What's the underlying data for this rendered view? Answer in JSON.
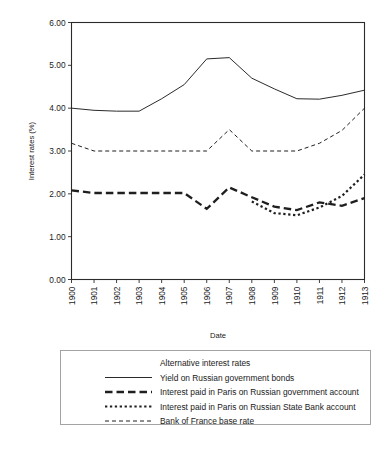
{
  "chart_data": {
    "type": "line",
    "title": "",
    "xlabel": "Date",
    "ylabel": "Interest rates (%)",
    "x": [
      "1900",
      "1901",
      "1902",
      "1903",
      "1904",
      "1905",
      "1906",
      "1907",
      "1908",
      "1909",
      "1910",
      "1911",
      "1912",
      "1913"
    ],
    "xlim": [
      1900,
      1913
    ],
    "ylim": [
      0.0,
      6.0
    ],
    "yticks": [
      "0.00",
      "1.00",
      "2.00",
      "3.00",
      "4.00",
      "5.00",
      "6.00"
    ],
    "grid": false,
    "legend_position": "below-plot",
    "legend_title": "Alternative interest rates",
    "series": [
      {
        "name": "Yield on Russian government bonds",
        "style": "solid-thin",
        "values": [
          4.0,
          3.95,
          3.93,
          3.93,
          4.22,
          4.55,
          5.15,
          5.18,
          4.7,
          4.45,
          4.22,
          4.21,
          4.3,
          4.42
        ]
      },
      {
        "name": "Interest paid in Paris on Russian government account",
        "style": "dash-thick-long",
        "values": [
          2.08,
          2.02,
          2.02,
          2.02,
          2.02,
          2.02,
          1.65,
          2.15,
          1.92,
          1.7,
          1.62,
          1.8,
          1.72,
          1.9
        ]
      },
      {
        "name": "Interest paid in Paris on Russian State Bank account",
        "style": "dot-thick-short",
        "values": [
          null,
          null,
          null,
          null,
          null,
          null,
          null,
          null,
          1.82,
          1.55,
          1.5,
          1.68,
          1.95,
          2.45
        ]
      },
      {
        "name": "Bank of France base rate",
        "style": "dash-thin-short",
        "values": [
          3.18,
          3.0,
          3.0,
          3.0,
          3.0,
          3.0,
          3.0,
          3.5,
          3.0,
          3.0,
          3.0,
          3.18,
          3.48,
          4.0
        ]
      }
    ]
  },
  "legend": {
    "title": "Alternative interest rates",
    "entries": [
      {
        "label": "Yield on Russian government bonds",
        "style": "solid-thin"
      },
      {
        "label": "Interest paid in Paris on Russian government account",
        "style": "dash-thick-long"
      },
      {
        "label": "Interest paid in Paris on Russian State Bank account",
        "style": "dot-thick-short"
      },
      {
        "label": "Bank of France base rate",
        "style": "dash-thin-short"
      }
    ]
  }
}
